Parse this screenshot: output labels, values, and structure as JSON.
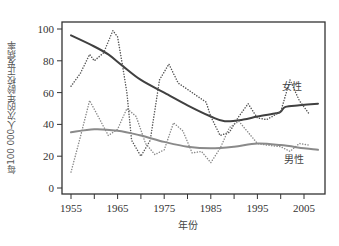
{
  "chart_data": {
    "type": "line",
    "title": "",
    "xlabel": "年份",
    "ylabel": "每100 000人次的年龄校正发病率",
    "xlim": [
      1953,
      2010
    ],
    "ylim": [
      0,
      105
    ],
    "x_ticks": [
      1955,
      1960,
      1965,
      1970,
      1975,
      1980,
      1985,
      1990,
      1995,
      2000,
      2005
    ],
    "x_tick_labels": [
      "1955",
      "1965",
      "1975",
      "1985",
      "1995",
      "2005"
    ],
    "y_ticks": [
      0,
      20,
      40,
      60,
      80,
      100
    ],
    "y_tick_labels": [
      "0",
      "20",
      "40",
      "60",
      "80",
      "100"
    ],
    "grid": false,
    "legend": "inline labels on right",
    "series": [
      {
        "name": "女性",
        "style": "solid",
        "kind": "trend",
        "color": "#404040",
        "x": [
          1955,
          1960,
          1963,
          1966,
          1970,
          1975,
          1980,
          1985,
          1988,
          1992,
          1995,
          1999,
          2000,
          2001,
          2004,
          2008
        ],
        "values": [
          96,
          89,
          84,
          77,
          68,
          60,
          52,
          45,
          42,
          43,
          45,
          47,
          48,
          51,
          52,
          53
        ]
      },
      {
        "name": "女性 (observed)",
        "style": "dotted",
        "kind": "observed",
        "color": "#555555",
        "x": [
          1955,
          1957,
          1959,
          1960,
          1962,
          1964,
          1965,
          1966,
          1967,
          1968,
          1970,
          1972,
          1974,
          1976,
          1977,
          1978,
          1980,
          1982,
          1984,
          1985,
          1987,
          1989,
          1991,
          1993,
          1995,
          1997,
          2000,
          2002,
          2004,
          2006
        ],
        "values": [
          64,
          72,
          84,
          80,
          85,
          99,
          95,
          78,
          60,
          30,
          20,
          30,
          68,
          78,
          72,
          66,
          62,
          58,
          54,
          45,
          33,
          35,
          45,
          53,
          44,
          43,
          48,
          68,
          55,
          47
        ]
      },
      {
        "name": "男性",
        "style": "solid",
        "kind": "trend",
        "color": "#8a8a8a",
        "x": [
          1955,
          1960,
          1965,
          1970,
          1975,
          1980,
          1985,
          1990,
          1995,
          2000,
          2005,
          2008
        ],
        "values": [
          35,
          37,
          36,
          33,
          29,
          26,
          25,
          26,
          28,
          27,
          25,
          24
        ]
      },
      {
        "name": "男性 (observed)",
        "style": "dotted",
        "kind": "observed",
        "color": "#8a8a8a",
        "x": [
          1955,
          1957,
          1959,
          1961,
          1963,
          1965,
          1967,
          1969,
          1971,
          1973,
          1975,
          1977,
          1979,
          1981,
          1983,
          1985,
          1987,
          1989,
          1991,
          1993,
          1995,
          1997,
          2000,
          2002,
          2004,
          2006
        ],
        "values": [
          10,
          32,
          55,
          44,
          33,
          37,
          50,
          45,
          28,
          21,
          24,
          41,
          36,
          22,
          23,
          16,
          25,
          38,
          42,
          35,
          28,
          27,
          26,
          23,
          28,
          27
        ]
      }
    ],
    "annotations": [
      {
        "text": "女性",
        "x": 2003,
        "y": 61
      },
      {
        "text": "男性",
        "x": 2003,
        "y": 14
      }
    ]
  },
  "labels": {
    "xlabel": "年份",
    "ylabel": "每100 000人次的年龄校正发病率",
    "female": "女性",
    "male": "男性"
  }
}
